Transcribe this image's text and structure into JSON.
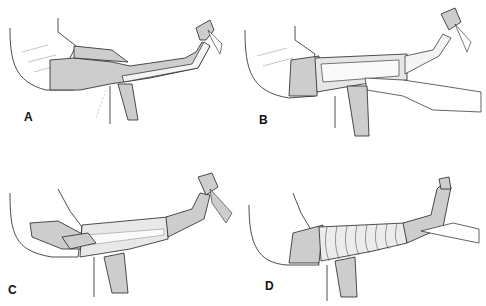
{
  "figure": {
    "panels": [
      {
        "id": "A",
        "label": "A",
        "description": "Leg extended, foot held up; single longitudinal strip along the side of the leg"
      },
      {
        "id": "B",
        "label": "B",
        "description": "Longitudinal strips applied on both sides with horizontal anchors; assistant's hands hold the strip"
      },
      {
        "id": "C",
        "label": "C",
        "description": "Hands wrapping circular turns around the leg over the strips"
      },
      {
        "id": "D",
        "label": "D",
        "description": "Leg completely wrapped in overlapping spiral turns; foot supported by a hand"
      }
    ],
    "colors": {
      "skin_fill": "#cdcdcd",
      "outline": "#222222",
      "bandage": "#f4f4f4",
      "background": "#ffffff"
    }
  }
}
